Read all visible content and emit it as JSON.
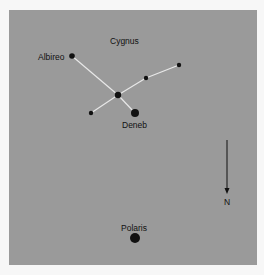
{
  "diagram": {
    "title": "Cygnus",
    "labels": {
      "constellation": "Cygnus",
      "albireo": "Albireo",
      "deneb": "Deneb",
      "polaris": "Polaris",
      "direction": "N"
    },
    "colors": {
      "background": "#9a9a9a",
      "line": "#e8e8e8",
      "star": "#111111",
      "page": "#f7f7f7"
    },
    "stars": [
      {
        "name": "Albireo",
        "x": 72,
        "y": 56,
        "r": 2.8
      },
      {
        "name": "Sadr",
        "x": 118,
        "y": 95,
        "r": 3.2
      },
      {
        "name": "Deneb",
        "x": 135,
        "y": 113,
        "r": 4
      },
      {
        "name": "",
        "x": 146,
        "y": 78,
        "r": 2.2
      },
      {
        "name": "",
        "x": 179,
        "y": 65,
        "r": 2.2
      },
      {
        "name": "",
        "x": 91,
        "y": 113,
        "r": 2.2
      },
      {
        "name": "Polaris",
        "x": 135,
        "y": 238,
        "r": 5
      }
    ],
    "north_arrow": {
      "label": "N",
      "x": 227,
      "y_start": 140,
      "y_end": 194
    }
  }
}
